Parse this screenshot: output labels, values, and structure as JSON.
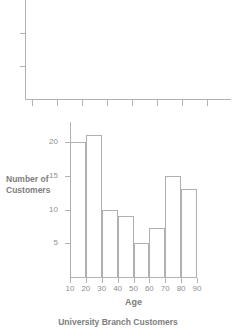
{
  "chart_data": [
    {
      "type": "bar",
      "title": "",
      "xlabel": "",
      "ylabel": "",
      "categories": [],
      "values": [],
      "xticks": [
        "",
        "",
        "",
        "",
        "",
        "",
        "",
        "",
        ""
      ],
      "yticks": [
        "",
        ""
      ],
      "grid": false,
      "legend": "none",
      "note": "empty cropped axes frame, no plotted data or tick labels"
    },
    {
      "type": "bar",
      "title": "University Branch Customers",
      "xlabel": "Age",
      "ylabel": "Number of Customers",
      "categories": [
        "10-20",
        "20-30",
        "30-40",
        "40-50",
        "50-60",
        "60-70",
        "70-80",
        "80-90"
      ],
      "bin_edges": [
        10,
        20,
        30,
        40,
        50,
        60,
        70,
        80,
        90
      ],
      "values": [
        20,
        21,
        10,
        9,
        5,
        7.3,
        15,
        13
      ],
      "xticks": [
        "10",
        "20",
        "30",
        "40",
        "50",
        "60",
        "70",
        "80",
        "90"
      ],
      "yticks": [
        "5",
        "10",
        "15",
        "20"
      ],
      "ytick_values": [
        5,
        10,
        15,
        20
      ],
      "xlim": [
        10,
        90
      ],
      "ylim": [
        0,
        23
      ],
      "grid": false,
      "legend": "none"
    }
  ],
  "colors": {
    "background": "#ffffff",
    "axis": "#b2b2b2",
    "bar_stroke": "#b0b0b0",
    "text": "#7d7d7d",
    "tick_label": "#8f8f8f"
  },
  "top_chart": {
    "label": "empty-axes"
  },
  "histogram": {
    "y_axis_title": "Number of Customers",
    "y_axis_title_line1": "Number of",
    "y_axis_title_line2": "Customers",
    "x_axis_title": "Age",
    "caption": "University Branch Customers"
  }
}
